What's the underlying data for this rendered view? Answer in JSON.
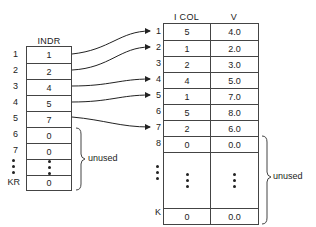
{
  "indr_table": {
    "header": "INDR",
    "rows": [
      {
        "index": "1",
        "value": "1"
      },
      {
        "index": "2",
        "value": "2"
      },
      {
        "index": "3",
        "value": "4"
      },
      {
        "index": "4",
        "value": "5"
      },
      {
        "index": "5",
        "value": "7"
      },
      {
        "index": "6",
        "value": "0"
      },
      {
        "index": "7",
        "value": "0"
      },
      {
        "index": "...",
        "value": "..."
      },
      {
        "index": "KR",
        "value": "0"
      }
    ],
    "unused_label": "unused"
  },
  "value_table": {
    "headers": [
      "I COL",
      "V"
    ],
    "rows": [
      {
        "index": "1",
        "icol": "5",
        "v": "4.0"
      },
      {
        "index": "2",
        "icol": "1",
        "v": "2.0"
      },
      {
        "index": "3",
        "icol": "2",
        "v": "3.0"
      },
      {
        "index": "4",
        "icol": "4",
        "v": "5.0"
      },
      {
        "index": "5",
        "icol": "1",
        "v": "7.0"
      },
      {
        "index": "6",
        "icol": "5",
        "v": "8.0"
      },
      {
        "index": "7",
        "icol": "2",
        "v": "6.0"
      },
      {
        "index": "8",
        "icol": "0",
        "v": "0.0"
      },
      {
        "index": "...",
        "icol": "...",
        "v": "..."
      },
      {
        "index": "K",
        "icol": "0",
        "v": "0.0"
      }
    ],
    "unused_label": "unused"
  },
  "arrows": [
    {
      "from_indr_row": 1,
      "to_value_row": 1
    },
    {
      "from_indr_row": 2,
      "to_value_row": 2
    },
    {
      "from_indr_row": 3,
      "to_value_row": 4
    },
    {
      "from_indr_row": 4,
      "to_value_row": 5
    },
    {
      "from_indr_row": 5,
      "to_value_row": 7
    }
  ]
}
